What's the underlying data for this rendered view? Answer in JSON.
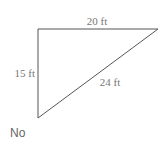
{
  "diagram": {
    "shape": "right-triangle",
    "vertices": {
      "top_left": [
        38,
        29
      ],
      "top_right": [
        158,
        29
      ],
      "bottom_left": [
        38,
        118
      ]
    },
    "sides": [
      {
        "id": "top",
        "label": "20 ft"
      },
      {
        "id": "left",
        "label": "15 ft"
      },
      {
        "id": "hypotenuse",
        "label": "24 ft"
      }
    ],
    "stroke_color": "#555555"
  },
  "answer": {
    "text": "No"
  }
}
